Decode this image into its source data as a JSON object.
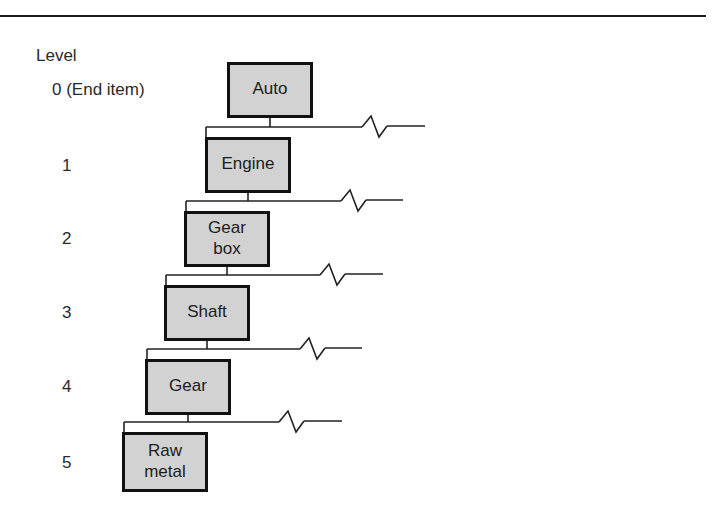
{
  "figure": {
    "title_caption": "Level",
    "top_rule_color": "#1b1b1b",
    "box_fill_color": "#d2d2d2",
    "box_border_color": "#111111",
    "connector_color": "#222222"
  },
  "levels": [
    {
      "label": "0 (End item)",
      "x": 52,
      "y": 81
    },
    {
      "label": "1",
      "x": 62,
      "y": 157
    },
    {
      "label": "2",
      "x": 62,
      "y": 230
    },
    {
      "label": "3",
      "x": 62,
      "y": 304
    },
    {
      "label": "4",
      "x": 62,
      "y": 378
    },
    {
      "label": "5",
      "x": 62,
      "y": 454
    }
  ],
  "nodes": [
    {
      "name": "Auto",
      "lines": [
        "Auto"
      ],
      "x": 227,
      "y": 62,
      "w": 86,
      "h": 56
    },
    {
      "name": "Engine",
      "lines": [
        "Engine"
      ],
      "x": 205,
      "y": 137,
      "w": 86,
      "h": 56
    },
    {
      "name": "Gear box",
      "lines": [
        "Gear",
        "box"
      ],
      "x": 184,
      "y": 211,
      "w": 86,
      "h": 56
    },
    {
      "name": "Shaft",
      "lines": [
        "Shaft"
      ],
      "x": 164,
      "y": 285,
      "w": 86,
      "h": 56
    },
    {
      "name": "Gear",
      "lines": [
        "Gear"
      ],
      "x": 145,
      "y": 359,
      "w": 86,
      "h": 56
    },
    {
      "name": "Raw metal",
      "lines": [
        "Raw",
        "metal"
      ],
      "x": 122,
      "y": 432,
      "w": 86,
      "h": 60
    }
  ],
  "connectors": [
    {
      "from": "Auto",
      "to": "Engine",
      "drop_x": 270,
      "bus_y": 127,
      "stub_x": 206,
      "bus_end_x": 425,
      "break_x": 374
    },
    {
      "from": "Engine",
      "to": "Gear box",
      "drop_x": 248,
      "bus_y": 201,
      "stub_x": 186,
      "bus_end_x": 403,
      "break_x": 353
    },
    {
      "from": "Gear box",
      "to": "Shaft",
      "drop_x": 227,
      "bus_y": 275,
      "stub_x": 166,
      "bus_end_x": 383,
      "break_x": 332
    },
    {
      "from": "Shaft",
      "to": "Gear",
      "drop_x": 207,
      "bus_y": 349,
      "stub_x": 147,
      "bus_end_x": 362,
      "break_x": 312
    },
    {
      "from": "Gear",
      "to": "Raw metal",
      "drop_x": 188,
      "bus_y": 422,
      "stub_x": 124,
      "bus_end_x": 342,
      "break_x": 291
    }
  ]
}
